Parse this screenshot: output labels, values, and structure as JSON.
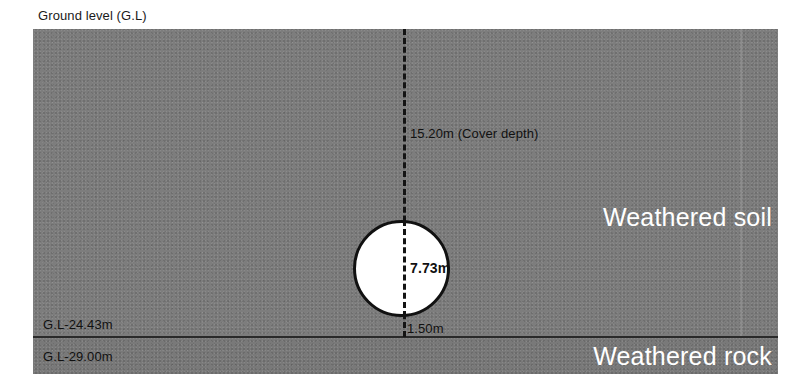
{
  "figure": {
    "type": "geotechnical-cross-section",
    "ground_level_label": "Ground level (G.L)"
  },
  "strata": {
    "soil": {
      "name": "Weathered soil",
      "color": "#7d7d7d"
    },
    "rock": {
      "name": "Weathered rock",
      "color": "#797979"
    },
    "boundary_color": "#2a2a2a"
  },
  "elevations": {
    "soil_rock_interface": "G.L-24.43m",
    "rock_base": "G.L-29.00m"
  },
  "dimensions": {
    "cover_depth": "15.20m (Cover depth)",
    "tunnel_diameter": "7.73m",
    "invert_clearance": "1.50m"
  },
  "tunnel": {
    "fill_color": "#ffffff",
    "outline_color": "#111111"
  },
  "chart_data": {
    "type": "diagram",
    "ground_level_m": 0,
    "layers": [
      {
        "name": "Weathered soil",
        "top_m": 0,
        "bottom_m": -24.43,
        "thickness_m": 24.43
      },
      {
        "name": "Weathered rock",
        "top_m": -24.43,
        "bottom_m": -29.0,
        "thickness_m": 4.57
      }
    ],
    "annotations": [
      {
        "label": "15.20m (Cover depth)",
        "value": 15.2,
        "unit": "m",
        "measures": "ground level to tunnel crown"
      },
      {
        "label": "7.73m",
        "value": 7.73,
        "unit": "m",
        "measures": "tunnel outer diameter"
      },
      {
        "label": "1.50m",
        "value": 1.5,
        "unit": "m",
        "measures": "tunnel invert to soil/rock interface"
      },
      {
        "label": "G.L-24.43m",
        "value": -24.43,
        "unit": "m",
        "measures": "weathered soil / weathered rock interface elevation"
      },
      {
        "label": "G.L-29.00m",
        "value": -29.0,
        "unit": "m",
        "measures": "base of weathered rock elevation"
      }
    ]
  }
}
